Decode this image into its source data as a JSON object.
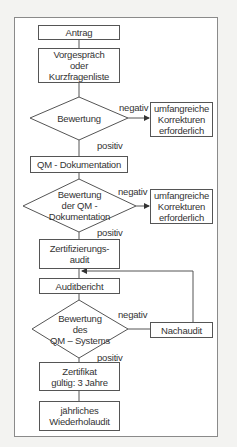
{
  "nodes": {
    "antrag": "Antrag",
    "vorgespraech": "Vorgespräch\noder\nKurzfragenliste",
    "bewertung1": "Bewertung",
    "korrekturen1": "umfangreiche\nKorrekturen\nerforderlich",
    "qm_dok": "QM - Dokumentation",
    "bewertung2": "Bewertung\nder QM -\nDokumentation",
    "korrekturen2": "umfangreiche\nKorrekturen\nerforderlich",
    "zertifizierungsaudit": "Zertifizierungs-\naudit",
    "auditbericht": "Auditbericht",
    "bewertung3": "Bewertung\ndes\nQM – Systems",
    "nachaudit": "Nachaudit",
    "zertifikat": "Zertifikat\ngültig: 3 Jahre",
    "wiederholaudit": "jährliches\nWiederholaudit"
  },
  "edges": {
    "neg1": "negativ",
    "pos1": "positiv",
    "neg2": "negativ",
    "pos2": "positiv",
    "neg3": "negativ",
    "pos3": "positiv"
  }
}
